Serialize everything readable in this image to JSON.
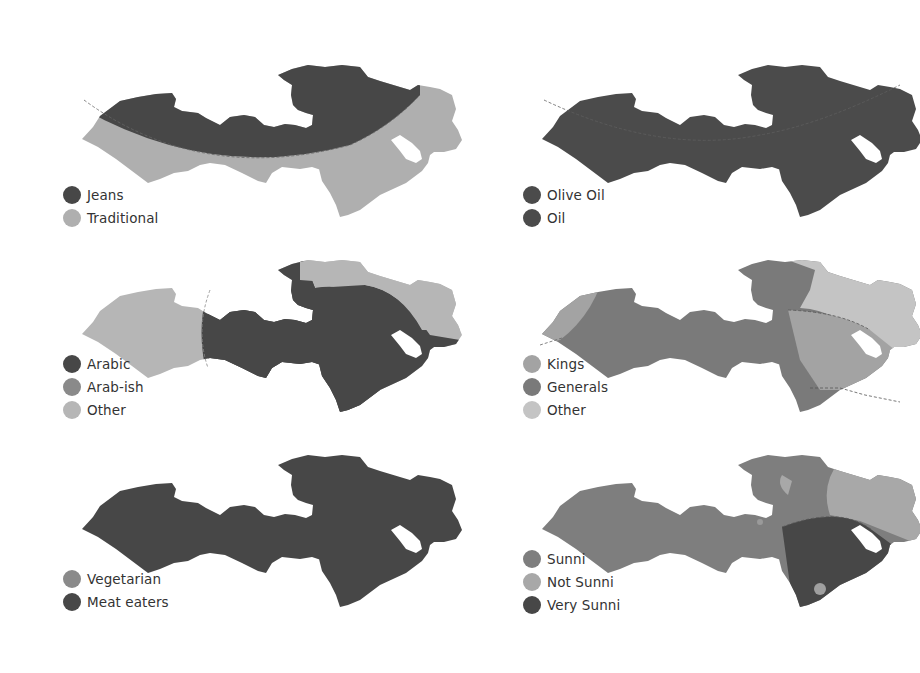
{
  "colors": {
    "dark": "#4a4a4a",
    "mid": "#7e7e7e",
    "light": "#b0b0b0",
    "lighter": "#c6c6c6",
    "text": "#333333"
  },
  "maps": [
    {
      "id": "clothing",
      "legend": [
        {
          "label": "Jeans",
          "color": "#474747"
        },
        {
          "label": "Traditional",
          "color": "#afafaf"
        }
      ]
    },
    {
      "id": "oil",
      "legend": [
        {
          "label": "Olive Oil",
          "color": "#4b4b4b"
        },
        {
          "label": "Oil",
          "color": "#4b4b4b"
        }
      ]
    },
    {
      "id": "language",
      "legend": [
        {
          "label": "Arabic",
          "color": "#474747"
        },
        {
          "label": "Arab-ish",
          "color": "#8a8a8a"
        },
        {
          "label": "Other",
          "color": "#b6b6b6"
        }
      ]
    },
    {
      "id": "rulers",
      "legend": [
        {
          "label": "Kings",
          "color": "#a3a3a3"
        },
        {
          "label": "Generals",
          "color": "#7a7a7a"
        },
        {
          "label": "Other",
          "color": "#c4c4c4"
        }
      ]
    },
    {
      "id": "diet",
      "legend": [
        {
          "label": "Vegetarian",
          "color": "#8a8a8a"
        },
        {
          "label": "Meat eaters",
          "color": "#474747"
        }
      ]
    },
    {
      "id": "religion",
      "legend": [
        {
          "label": "Sunni",
          "color": "#7e7e7e"
        },
        {
          "label": "Not Sunni",
          "color": "#a8a8a8"
        },
        {
          "label": "Very Sunni",
          "color": "#474747"
        }
      ]
    }
  ]
}
